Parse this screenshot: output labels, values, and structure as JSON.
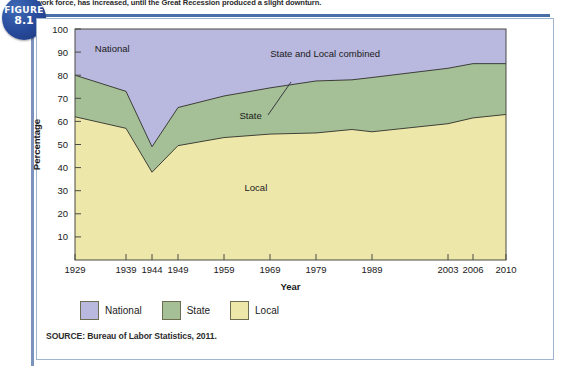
{
  "caption": "work force, has increased, until the Great Recession produced a slight downturn.",
  "figure_badge": {
    "word": "FIGURE",
    "number": "8.1"
  },
  "source": "SOURCE: Bureau of Labor Statistics, 2011.",
  "legend": {
    "items": [
      {
        "label": "National",
        "color": "#b9b8de"
      },
      {
        "label": "State",
        "color": "#a5bf97"
      },
      {
        "label": "Local",
        "color": "#ede7aa"
      }
    ]
  },
  "chart_data": {
    "type": "area",
    "stacked": true,
    "title": "",
    "xlabel": "Year",
    "ylabel": "Percentage",
    "ylim": [
      0,
      100
    ],
    "yticks": [
      10,
      20,
      30,
      40,
      50,
      60,
      70,
      80,
      90,
      100
    ],
    "grid": false,
    "legend_position": "bottom",
    "categories": [
      "1929",
      "1939",
      "1944",
      "1949",
      "1959",
      "1969",
      "1979",
      "1987",
      "1989",
      "2003",
      "2006",
      "2010"
    ],
    "x_tick_labels": [
      "1929",
      "1939",
      "1944",
      "1949",
      "1959",
      "1969",
      "1979",
      "1989",
      "2003",
      "2006",
      "2010"
    ],
    "series": [
      {
        "name": "Local",
        "values": [
          62,
          57,
          38,
          49.5,
          53,
          54.5,
          55,
          56.5,
          55.5,
          59,
          61.5,
          63
        ]
      },
      {
        "name": "State",
        "values": [
          18,
          16,
          11,
          16.5,
          18,
          20,
          22.5,
          21.5,
          23.5,
          24,
          24,
          22
        ]
      },
      {
        "name": "National",
        "values": [
          20,
          27,
          51,
          34,
          29,
          25.5,
          22.5,
          22,
          21,
          17,
          15,
          15
        ]
      }
    ],
    "cumulative_local": [
      62,
      57,
      38,
      49.5,
      53,
      54.5,
      55,
      56.5,
      55.5,
      59,
      61.5,
      63
    ],
    "cumulative_state_and_local": [
      80,
      73,
      49,
      66,
      71,
      74.5,
      77.5,
      78,
      79,
      83,
      85,
      85
    ],
    "annotations": [
      {
        "text": "National",
        "x_value": "1936",
        "y_value": 90
      },
      {
        "text": "State",
        "x_value": "1962",
        "y_value": 61
      },
      {
        "text": "Local",
        "x_value": "1963",
        "y_value": 30
      },
      {
        "text": "State and Local combined",
        "x_value": "1976",
        "y_value": 88
      }
    ]
  }
}
